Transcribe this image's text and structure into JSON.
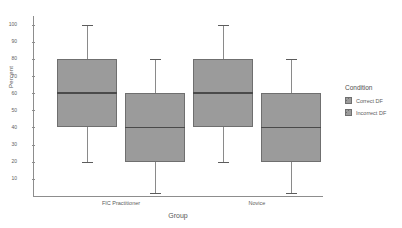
{
  "chart": {
    "type": "box",
    "ylabel": "Percent",
    "xlabel": "Group"
  },
  "legend": {
    "title": "Condition",
    "items": [
      {
        "label": "Correct DF",
        "color": "#9b9b9b"
      },
      {
        "label": "Incorrect DF",
        "color": "#9b9b9b"
      }
    ]
  },
  "yaxis": {
    "ticks": [
      {
        "label": "100",
        "value": 100
      },
      {
        "label": "90",
        "value": 90
      },
      {
        "label": "80",
        "value": 80
      },
      {
        "label": "70",
        "value": 70
      },
      {
        "label": "60",
        "value": 60
      },
      {
        "label": "50",
        "value": 50
      },
      {
        "label": "40",
        "value": 40
      },
      {
        "label": "30",
        "value": 30
      },
      {
        "label": "20",
        "value": 20
      },
      {
        "label": "10",
        "value": 10
      }
    ]
  },
  "xaxis": {
    "groups": [
      {
        "label": "FIC Practitioner"
      },
      {
        "label": "Novice"
      }
    ]
  },
  "chart_data": {
    "type": "box",
    "title": "",
    "xlabel": "Group",
    "ylabel": "Percent",
    "ylim": [
      0,
      105
    ],
    "grid": false,
    "legend_position": "right",
    "categories": [
      "FIC Practitioner",
      "Novice"
    ],
    "series": [
      {
        "name": "Correct DF",
        "color": "#9b9b9b",
        "boxes": [
          {
            "category": "FIC Practitioner",
            "whisker_low": 20,
            "q1": 40,
            "median": 60,
            "q3": 80,
            "whisker_high": 100
          },
          {
            "category": "Novice",
            "whisker_low": 20,
            "q1": 40,
            "median": 60,
            "q3": 80,
            "whisker_high": 100
          }
        ]
      },
      {
        "name": "Incorrect DF",
        "color": "#9b9b9b",
        "boxes": [
          {
            "category": "FIC Practitioner",
            "whisker_low": 2,
            "q1": 20,
            "median": 40,
            "q3": 60,
            "whisker_high": 80
          },
          {
            "category": "Novice",
            "whisker_low": 2,
            "q1": 20,
            "median": 40,
            "q3": 60,
            "whisker_high": 80
          }
        ]
      }
    ]
  }
}
